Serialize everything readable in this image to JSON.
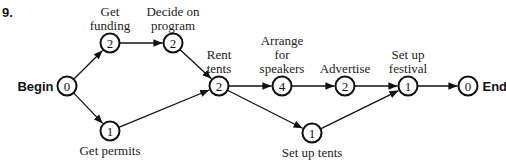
{
  "problem_number": "9.",
  "nodes": [
    {
      "id": "begin",
      "value": "0",
      "label": [
        "Begin"
      ],
      "label_style": "bold",
      "label_pos": "left"
    },
    {
      "id": "get-funding",
      "value": "2",
      "label": [
        "Get",
        "funding"
      ],
      "label_pos": "above"
    },
    {
      "id": "get-permits",
      "value": "1",
      "label": [
        "Get permits"
      ],
      "label_pos": "below"
    },
    {
      "id": "decide-on-program",
      "value": "2",
      "label": [
        "Decide on",
        "program"
      ],
      "label_pos": "above"
    },
    {
      "id": "rent-tents",
      "value": "2",
      "label": [
        "Rent",
        "tents"
      ],
      "label_pos": "above"
    },
    {
      "id": "arrange-for-speakers",
      "value": "4",
      "label": [
        "Arrange",
        "for",
        "speakers"
      ],
      "label_pos": "above"
    },
    {
      "id": "set-up-tents",
      "value": "1",
      "label": [
        "Set up tents"
      ],
      "label_pos": "below"
    },
    {
      "id": "advertise",
      "value": "2",
      "label": [
        "Advertise"
      ],
      "label_pos": "above"
    },
    {
      "id": "set-up-festival",
      "value": "1",
      "label": [
        "Set up",
        "festival"
      ],
      "label_pos": "above"
    },
    {
      "id": "end",
      "value": "0",
      "label": [
        "End"
      ],
      "label_style": "bold",
      "label_pos": "right"
    }
  ],
  "edges": [
    {
      "from": "begin",
      "to": "get-funding"
    },
    {
      "from": "begin",
      "to": "get-permits"
    },
    {
      "from": "get-funding",
      "to": "decide-on-program"
    },
    {
      "from": "decide-on-program",
      "to": "rent-tents"
    },
    {
      "from": "get-permits",
      "to": "rent-tents"
    },
    {
      "from": "rent-tents",
      "to": "arrange-for-speakers"
    },
    {
      "from": "rent-tents",
      "to": "set-up-tents"
    },
    {
      "from": "arrange-for-speakers",
      "to": "advertise"
    },
    {
      "from": "advertise",
      "to": "set-up-festival"
    },
    {
      "from": "set-up-tents",
      "to": "set-up-festival"
    },
    {
      "from": "set-up-festival",
      "to": "end"
    }
  ]
}
